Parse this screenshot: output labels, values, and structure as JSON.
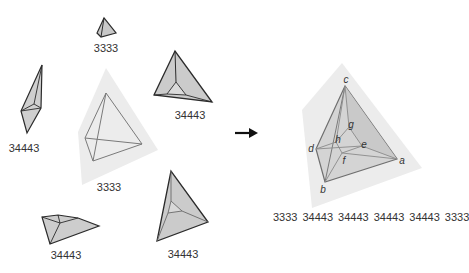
{
  "figure": {
    "left_group": {
      "items": [
        {
          "id": "small-top",
          "label": "3333"
        },
        {
          "id": "spindle-left",
          "label": "34443"
        },
        {
          "id": "tetra-top-right",
          "label": "34443"
        },
        {
          "id": "center-halo",
          "label": "3333"
        },
        {
          "id": "flat-bottom-left",
          "label": "34443"
        },
        {
          "id": "tetra-bottom-right",
          "label": "34443"
        }
      ]
    },
    "arrow": {
      "icon": "right-arrow-icon"
    },
    "right_group": {
      "vertices": {
        "a": "a",
        "b": "b",
        "c": "c",
        "d": "d",
        "e": "e",
        "f": "f",
        "g": "g",
        "h": "h"
      },
      "sequence": [
        "3333",
        "34443",
        "34443",
        "34443",
        "34443",
        "3333"
      ]
    },
    "colors": {
      "edge_dark": "#2b2b2b",
      "edge_mid": "#7a7a7a",
      "face_fill": "#c8c8c8",
      "halo_fill": "#ececec",
      "text": "#333333"
    }
  }
}
